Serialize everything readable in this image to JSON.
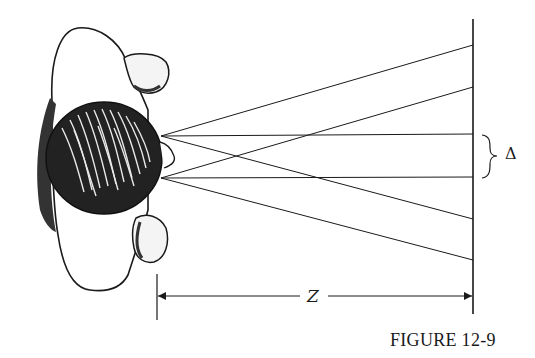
{
  "figure": {
    "caption": "FIGURE 12-9",
    "distance_label": "Z",
    "separation_label": "Δ",
    "colors": {
      "ink": "#1a1a1a",
      "background": "#ffffff"
    }
  },
  "geometry": {
    "screen_x": 473,
    "screen_top": 19,
    "screen_bottom": 314,
    "eyes": [
      {
        "name": "upper-eye",
        "x": 161,
        "y": 136,
        "ray_targets_y": [
          45,
          134,
          219
        ]
      },
      {
        "name": "lower-eye",
        "x": 161,
        "y": 178,
        "ray_targets_y": [
          87,
          177,
          260
        ]
      }
    ],
    "dimension_z": {
      "x_start": 157,
      "x_end": 473,
      "y": 296
    },
    "brace_delta": {
      "y_top": 135,
      "y_bottom": 178,
      "x": 482
    }
  }
}
